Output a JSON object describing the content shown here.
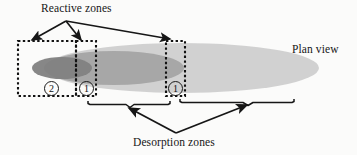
{
  "figure": {
    "labels": {
      "reactive_zones": "Reactive zones",
      "plan_view": "Plan view",
      "desorption_zones": "Desorption zones"
    },
    "zone_markers": [
      {
        "id": "zone-2",
        "number": "2",
        "x": 44,
        "y": 81
      },
      {
        "id": "zone-1-left",
        "number": "1",
        "x": 79,
        "y": 81
      },
      {
        "id": "zone-1-right",
        "number": "1",
        "x": 168,
        "y": 81
      }
    ],
    "dotted_boxes": [
      {
        "id": "box-zone-2",
        "x": 18,
        "y": 41,
        "width": 58,
        "height": 55
      },
      {
        "id": "box-zone-1-left",
        "x": 76,
        "y": 41,
        "width": 20,
        "height": 55
      },
      {
        "id": "box-zone-1-right",
        "x": 166,
        "y": 41,
        "width": 19,
        "height": 55
      }
    ],
    "plume_ellipses": [
      {
        "id": "plume-outer",
        "cx": 182,
        "cy": 68,
        "rx": 137,
        "ry": 25,
        "color": "#cfcfcf"
      },
      {
        "id": "plume-middle",
        "cx": 114,
        "cy": 68,
        "rx": 70,
        "ry": 17,
        "color": "#a8a8a8"
      },
      {
        "id": "plume-inner",
        "cx": 62,
        "cy": 68,
        "rx": 30,
        "ry": 11,
        "color": "#8a8a8a"
      }
    ],
    "leader_lines": {
      "reactive_origin": {
        "x": 66,
        "y": 21
      },
      "reactive_targets": [
        {
          "x": 30,
          "y": 41
        },
        {
          "x": 80,
          "y": 41
        },
        {
          "x": 170,
          "y": 40
        }
      ],
      "desorption_origin": {
        "x": 176,
        "y": 133
      },
      "desorption_targets": [
        {
          "x": 130,
          "y": 107
        },
        {
          "x": 248,
          "y": 104
        }
      ]
    },
    "braces": [
      {
        "id": "brace-left",
        "x1": 88,
        "x2": 172,
        "y": 101,
        "apex_x": 130
      },
      {
        "id": "brace-right",
        "x1": 178,
        "x2": 296,
        "y": 99,
        "apex_x": 248
      }
    ],
    "colors": {
      "ink": "#161616",
      "plume_outer": "#cfcfcf",
      "plume_middle": "#a8a8a8",
      "plume_inner": "#8a8a8a",
      "background": "#fbfbfa"
    }
  }
}
